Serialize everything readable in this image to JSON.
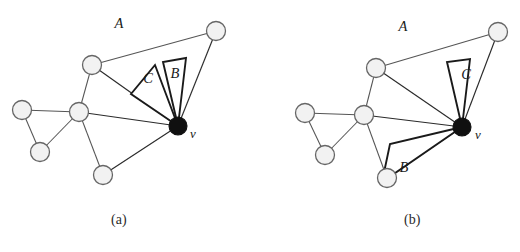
{
  "figure": {
    "type": "diagram",
    "panels": [
      {
        "id": "a",
        "caption": "(a)",
        "caption_position": {
          "x": 125,
          "y": 222
        },
        "region_labels": [
          {
            "name": "A",
            "x": 119,
            "y": 28
          },
          {
            "name": "B",
            "x": 175,
            "y": 78
          },
          {
            "name": "C",
            "x": 148,
            "y": 83
          }
        ],
        "vertex_label": {
          "name": "v",
          "x": 193,
          "y": 138
        },
        "nodes": [
          {
            "id": "n1",
            "x": 92,
            "y": 65,
            "state": "open"
          },
          {
            "id": "n2",
            "x": 216,
            "y": 31,
            "state": "open"
          },
          {
            "id": "n3",
            "x": 79,
            "y": 112,
            "state": "open"
          },
          {
            "id": "n4",
            "x": 22,
            "y": 110,
            "state": "open"
          },
          {
            "id": "n5",
            "x": 40,
            "y": 152,
            "state": "open"
          },
          {
            "id": "n6",
            "x": 103,
            "y": 175,
            "state": "open"
          },
          {
            "id": "v",
            "x": 178,
            "y": 126,
            "state": "filled"
          }
        ],
        "edges": [
          {
            "from": "n1",
            "to": "n2"
          },
          {
            "from": "n1",
            "to": "n3"
          },
          {
            "from": "n2",
            "to": "v"
          },
          {
            "from": "n1",
            "to": "v"
          },
          {
            "from": "n3",
            "to": "n4"
          },
          {
            "from": "n3",
            "to": "n5"
          },
          {
            "from": "n4",
            "to": "n5"
          },
          {
            "from": "n3",
            "to": "n6"
          },
          {
            "from": "n3",
            "to": "v"
          },
          {
            "from": "n6",
            "to": "v"
          }
        ],
        "wedges": [
          {
            "label": "B",
            "apex_x": 178,
            "apex_y": 126,
            "p1_x": 163,
            "p1_y": 62,
            "p2_x": 186,
            "p2_y": 58
          },
          {
            "label": "C",
            "apex_x": 178,
            "apex_y": 126,
            "p1_x": 131,
            "p1_y": 94,
            "p2_x": 155,
            "p2_y": 65
          }
        ]
      },
      {
        "id": "b",
        "caption": "(b)",
        "caption_position": {
          "x": 418,
          "y": 222
        },
        "region_labels": [
          {
            "name": "A",
            "x": 403,
            "y": 31
          },
          {
            "name": "B",
            "x": 404,
            "y": 172
          },
          {
            "name": "C",
            "x": 466,
            "y": 79
          }
        ],
        "vertex_label": {
          "name": "v",
          "x": 478,
          "y": 139
        },
        "nodes": [
          {
            "id": "n1",
            "x": 376,
            "y": 68,
            "state": "open"
          },
          {
            "id": "n2",
            "x": 498,
            "y": 32,
            "state": "open"
          },
          {
            "id": "n3",
            "x": 364,
            "y": 115,
            "state": "open"
          },
          {
            "id": "n4",
            "x": 305,
            "y": 113,
            "state": "open"
          },
          {
            "id": "n5",
            "x": 325,
            "y": 155,
            "state": "open"
          },
          {
            "id": "n6",
            "x": 387,
            "y": 178,
            "state": "open"
          },
          {
            "id": "v",
            "x": 462,
            "y": 127,
            "state": "filled"
          }
        ],
        "edges": [
          {
            "from": "n1",
            "to": "n2"
          },
          {
            "from": "n1",
            "to": "n3"
          },
          {
            "from": "n2",
            "to": "v"
          },
          {
            "from": "n1",
            "to": "v"
          },
          {
            "from": "n3",
            "to": "n4"
          },
          {
            "from": "n3",
            "to": "n5"
          },
          {
            "from": "n4",
            "to": "n5"
          },
          {
            "from": "n3",
            "to": "n6"
          },
          {
            "from": "n3",
            "to": "v"
          },
          {
            "from": "n6",
            "to": "v"
          }
        ],
        "wedges": [
          {
            "label": "C",
            "apex_x": 462,
            "apex_y": 127,
            "p1_x": 447,
            "p1_y": 62,
            "p2_x": 470,
            "p2_y": 59
          },
          {
            "label": "B",
            "apex_x": 462,
            "apex_y": 127,
            "p1_x": 390,
            "p1_y": 144,
            "p2_x": 382,
            "p2_y": 182
          }
        ]
      }
    ],
    "colors": {
      "edge": "#555555",
      "node_fill": "#f2f2f2",
      "node_stroke": "#666666",
      "vertex_fill": "#101010",
      "wedge_stroke": "#1a1a1a",
      "background": "#ffffff"
    },
    "node_radius": 9.5,
    "vertex_radius": 9
  }
}
